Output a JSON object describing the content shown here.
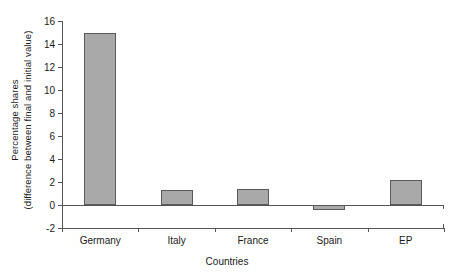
{
  "chart_data": {
    "type": "bar",
    "title": "",
    "subtitle": "",
    "categories": [
      "Germany",
      "Italy",
      "France",
      "Spain",
      "EP"
    ],
    "values": [
      15.0,
      1.3,
      1.4,
      -0.4,
      2.2
    ],
    "xlabel": "Countries",
    "ylabel_line1": "Percentage shares",
    "ylabel_line2": "(difference between final and initial value)",
    "ylim": [
      -2,
      16
    ],
    "ytick_labels": [
      "16",
      "14",
      "12",
      "10",
      "8",
      "6",
      "4",
      "2",
      "0",
      "-2"
    ],
    "ytick_values": [
      16,
      14,
      12,
      10,
      8,
      6,
      4,
      2,
      0,
      -2
    ],
    "ytick_step": 2,
    "grid": false,
    "legend": "none",
    "bar_fill_color": "#a9a9a9",
    "bar_border_color": "#5a5a5a",
    "axis_color": "#555555",
    "background_color": "#ffffff"
  }
}
